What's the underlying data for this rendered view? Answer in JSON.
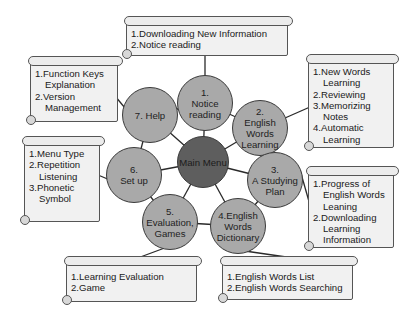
{
  "diagram": {
    "center": {
      "label": "Main Menu"
    },
    "nodes": [
      {
        "id": "n1",
        "label": "1.\nNotice\nreading"
      },
      {
        "id": "n2",
        "label": "2.\nEnglish\nWords\nLearning"
      },
      {
        "id": "n3",
        "label": "3.\nA Studying\nPlan"
      },
      {
        "id": "n4",
        "label": "4.English\nWords\nDictionary"
      },
      {
        "id": "n5",
        "label": "5.\nEvaluation,\nGames"
      },
      {
        "id": "n6",
        "label": "6.\nSet up"
      },
      {
        "id": "n7",
        "label": "7. Help"
      }
    ],
    "notes": {
      "notice": [
        "1.Downloading New Information",
        "2.Notice reading"
      ],
      "learning": [
        "1.New Words Learning",
        "2.Reviewing",
        "3.Memorizing Notes",
        "4.Automatic Learning"
      ],
      "plan": [
        "1.Progress of English Words Leaning",
        "2.Downloading Learning Information"
      ],
      "dictionary": [
        "1.English Words List",
        "2.English Words Searching"
      ],
      "evaluation": [
        "1.Learning Evaluation",
        "2.Game"
      ],
      "setup": [
        "1.Menu Type",
        "2.Repetition Listening",
        "3.Phonetic Symbol"
      ],
      "help": [
        "1.Function Keys Explanation",
        "2.Version Management"
      ]
    },
    "colors": {
      "node": "#a9a9a9",
      "center": "#5e5e5e",
      "note_bg": "#f1f1f1",
      "line": "#2a2a2a"
    }
  }
}
